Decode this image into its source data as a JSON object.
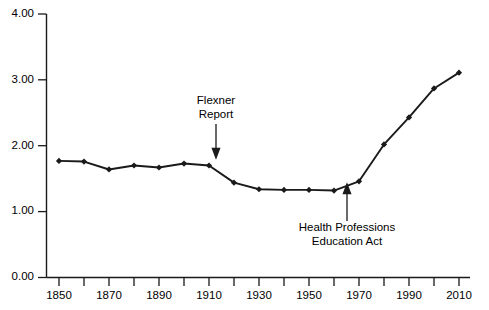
{
  "chart_data": {
    "type": "line",
    "title": "",
    "subtitle": "",
    "xlabel": "",
    "ylabel": "",
    "xlim": [
      1845,
      2015
    ],
    "ylim": [
      0.0,
      4.0
    ],
    "grid": false,
    "legend": "none",
    "line_color": "#1a1a1a",
    "marker": "diamond",
    "x_tick_labels": [
      "1850",
      "1870",
      "1890",
      "1910",
      "1930",
      "1950",
      "1970",
      "1990",
      "2010"
    ],
    "x_minor_ticks": [
      1860,
      1880,
      1900,
      1920,
      1940,
      1960,
      1980,
      2000
    ],
    "y_tick_labels": [
      "0.00",
      "1.00",
      "2.00",
      "3.00",
      "4.00"
    ],
    "x": [
      1850,
      1860,
      1870,
      1880,
      1890,
      1900,
      1910,
      1920,
      1930,
      1940,
      1950,
      1960,
      1970,
      1980,
      1990,
      2000,
      2010
    ],
    "values": [
      1.77,
      1.76,
      1.64,
      1.7,
      1.67,
      1.73,
      1.7,
      1.44,
      1.34,
      1.33,
      1.33,
      1.32,
      1.46,
      2.02,
      2.43,
      2.87,
      3.11
    ],
    "series": [
      {
        "name": "Physicians per 1,000 population",
        "values": [
          1.77,
          1.76,
          1.64,
          1.7,
          1.67,
          1.73,
          1.7,
          1.44,
          1.34,
          1.33,
          1.33,
          1.32,
          1.46,
          2.02,
          2.43,
          2.87,
          3.11
        ]
      }
    ],
    "annotations": [
      {
        "id": "flexner",
        "line1": "Flexner",
        "line2": "Report",
        "target_x": 1910,
        "target_y": 1.7
      },
      {
        "id": "hpea",
        "line1": "Health Professions",
        "line2": "Education Act",
        "target_x": 1965,
        "target_y": 1.36
      }
    ]
  }
}
